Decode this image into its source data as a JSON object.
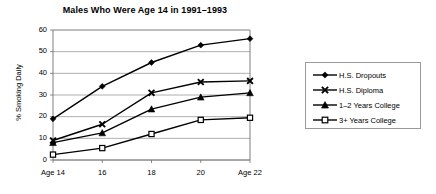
{
  "chart_data": {
    "type": "line",
    "title": "Males Who Were Age 14 in 1991–1993",
    "xlabel": "",
    "ylabel": "% Smoking Daily",
    "categories": [
      "Age 14",
      "16",
      "18",
      "20",
      "Age 22"
    ],
    "x": [
      14,
      16,
      18,
      20,
      22
    ],
    "ylim": [
      0,
      60
    ],
    "yticks": [
      0,
      10,
      20,
      30,
      40,
      50,
      60
    ],
    "grid": "horizontal",
    "legend_position": "right",
    "series": [
      {
        "name": "H.S. Dropouts",
        "marker": "diamond",
        "values": [
          19.0,
          34.0,
          45.0,
          53.0,
          56.0
        ]
      },
      {
        "name": "H.S. Diploma",
        "marker": "x",
        "values": [
          9.0,
          16.5,
          31.0,
          36.0,
          36.5
        ]
      },
      {
        "name": "1–2 Years College",
        "marker": "triangle",
        "values": [
          8.0,
          12.5,
          23.5,
          29.0,
          31.0
        ]
      },
      {
        "name": "3+ Years College",
        "marker": "open-square",
        "values": [
          2.5,
          5.5,
          12.0,
          18.5,
          19.5
        ]
      }
    ],
    "colors": {
      "line": "#000000",
      "grid": "#9a9a9a",
      "axis": "#6f6f6f",
      "background": "#ffffff"
    }
  }
}
